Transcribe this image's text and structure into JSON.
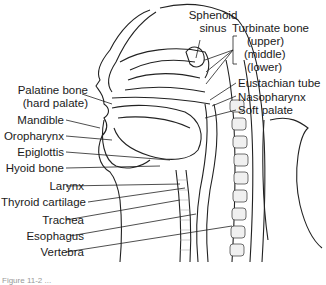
{
  "diagram": {
    "type": "anatomical sagittal section of head and neck",
    "labels_right": {
      "sphenoid_sinus_1": "Sphenoid",
      "sphenoid_sinus_2": "sinus",
      "turbinate": "Turbinate bone",
      "turbinate_upper": "(upper)",
      "turbinate_middle": "(middle)",
      "turbinate_lower": "(lower)",
      "eustachian": "Eustachian tube",
      "nasopharynx": "Nasopharynx",
      "soft_palate": "Soft palate"
    },
    "labels_left": {
      "palatine_1": "Palatine bone",
      "palatine_2": "(hard palate)",
      "mandible": "Mandible",
      "oropharynx": "Oropharynx",
      "epiglottis": "Epiglottis",
      "hyoid": "Hyoid bone",
      "larynx": "Larynx",
      "thyroid": "Thyroid cartilage",
      "trachea": "Trachea",
      "esophagus": "Esophagus",
      "vertebra": "Vertebra"
    },
    "caption": "Figure 11-2 ..."
  }
}
